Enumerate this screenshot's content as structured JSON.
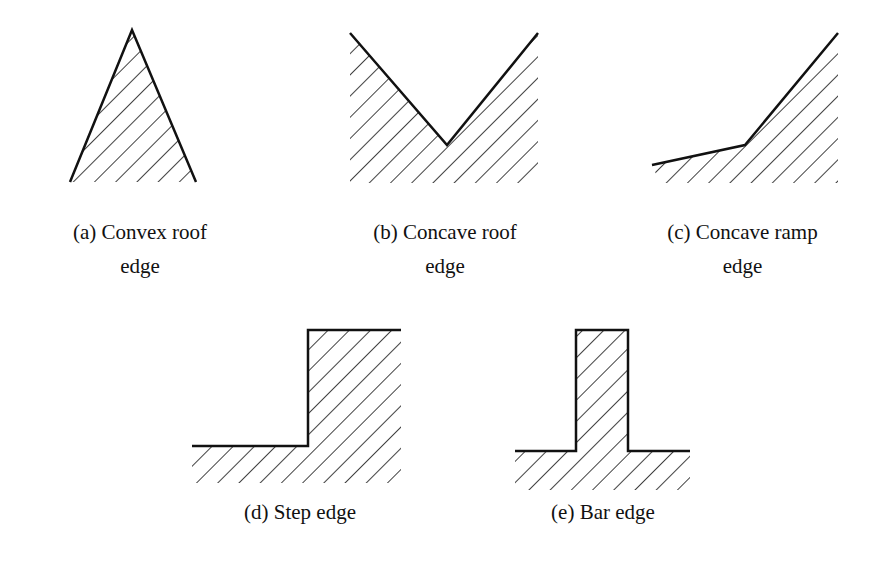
{
  "figure": {
    "panels": [
      {
        "id": "a",
        "line1": "(a) Convex roof",
        "line2": "edge",
        "shape": "convex-roof"
      },
      {
        "id": "b",
        "line1": "(b) Concave roof",
        "line2": "edge",
        "shape": "concave-roof"
      },
      {
        "id": "c",
        "line1": "(c) Concave ramp",
        "line2": "edge",
        "shape": "concave-ramp"
      },
      {
        "id": "d",
        "line1": "(d) Step edge",
        "line2": "",
        "shape": "step"
      },
      {
        "id": "e",
        "line1": "(e) Bar edge",
        "line2": "",
        "shape": "bar"
      }
    ],
    "colors": {
      "stroke": "#111111",
      "background": "#ffffff"
    }
  }
}
